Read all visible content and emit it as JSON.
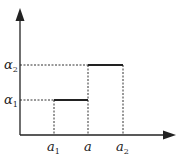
{
  "diagram": {
    "type": "step-function",
    "axes": {
      "origin": [
        20,
        135
      ],
      "y_top": 10,
      "x_right": 175,
      "color": "#222222"
    },
    "y_labels": [
      {
        "base": "α",
        "sub": "2",
        "y": 65
      },
      {
        "base": "α",
        "sub": "1",
        "y": 100
      }
    ],
    "x_labels": [
      {
        "base": "a",
        "sub": "1",
        "x": 54
      },
      {
        "base": "a",
        "sub": "",
        "x": 88
      },
      {
        "base": "a",
        "sub": "2",
        "x": 123
      }
    ],
    "segments": [
      {
        "from_x": 54,
        "to_x": 88,
        "level": "α1",
        "y": 100
      },
      {
        "from_x": 88,
        "to_x": 123,
        "level": "α2",
        "y": 65
      }
    ]
  }
}
